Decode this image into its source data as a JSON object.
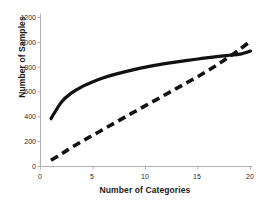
{
  "chart_data": {
    "type": "line",
    "title": "",
    "xlabel": "Number of Categories",
    "ylabel": "Number of Samples",
    "xlim": [
      0,
      20
    ],
    "ylim": [
      0,
      1200
    ],
    "xticks": [
      0,
      5,
      10,
      15,
      20
    ],
    "yticks": [
      0,
      200,
      400,
      600,
      800,
      1000,
      1200
    ],
    "grid": false,
    "legend": null,
    "axis_color": "#b0b0b0",
    "series": [
      {
        "name": "solid-curve",
        "style": "solid",
        "color": "#111111",
        "linewidth": 3.2,
        "x": [
          1,
          2,
          3,
          4,
          5,
          6,
          7,
          8,
          9,
          10,
          11,
          12,
          13,
          14,
          15,
          16,
          17,
          18,
          19,
          20
        ],
        "values": [
          385,
          520,
          595,
          645,
          683,
          714,
          740,
          762,
          782,
          800,
          816,
          830,
          843,
          855,
          866,
          877,
          887,
          896,
          905,
          930
        ]
      },
      {
        "name": "dashed-curve",
        "style": "dashed",
        "color": "#111111",
        "linewidth": 3.6,
        "x": [
          1,
          2,
          3,
          4,
          5,
          6,
          7,
          8,
          9,
          10,
          11,
          12,
          13,
          14,
          15,
          16,
          17,
          18,
          19,
          20
        ],
        "values": [
          50,
          102,
          155,
          205,
          252,
          300,
          348,
          396,
          443,
          490,
          537,
          584,
          631,
          678,
          725,
          775,
          828,
          885,
          945,
          1010
        ]
      }
    ],
    "annotations": []
  },
  "axes": {
    "ytick_labels": [
      "1200",
      "1000",
      "800",
      "600",
      "400",
      "200",
      "0"
    ],
    "xtick_labels": [
      "0",
      "5",
      "10",
      "15",
      "20"
    ],
    "ylabel_text": "Number of Samples",
    "xlabel_text": "Number of Categories"
  }
}
